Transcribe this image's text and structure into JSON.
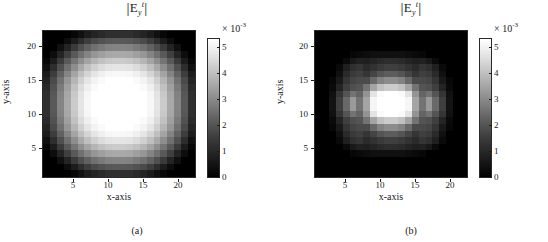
{
  "figure": {
    "panel_count": 2,
    "colormap": "grayscale-black-to-white"
  },
  "chart_data": [
    {
      "type": "heatmap",
      "panel": "a",
      "caption": "(a)",
      "title": "|E_y^t|",
      "title_parts": {
        "base": "E",
        "sub": "y",
        "sup": "t"
      },
      "xlabel": "x-axis",
      "ylabel": "y-axis",
      "xticks": [
        5,
        10,
        15,
        20
      ],
      "yticks": [
        5,
        10,
        15,
        20
      ],
      "xlim": [
        0.5,
        22.5
      ],
      "ylim": [
        0.5,
        22.5
      ],
      "grid_size": [
        22,
        22
      ],
      "colorbar": {
        "ticks": [
          0,
          1,
          2,
          3,
          4,
          5
        ],
        "tick_labels": [
          "0",
          "1",
          "2",
          "3",
          "4",
          "5"
        ],
        "exponent_label": "× 10",
        "exponent_value": "-3",
        "vmin": 0.0,
        "vmax": 0.0053,
        "units_multiplier": 0.001,
        "position": "right"
      },
      "description": "Smooth radially symmetric circular spot, bright saturated plateau at the centre decaying to black at the corners.",
      "values": [
        [
          0.0,
          0.0,
          0.0,
          0.0,
          0.02,
          0.05,
          0.09,
          0.12,
          0.14,
          0.16,
          0.16,
          0.16,
          0.16,
          0.14,
          0.12,
          0.09,
          0.05,
          0.02,
          0.0,
          0.0,
          0.0,
          0.0
        ],
        [
          0.0,
          0.0,
          0.0,
          0.04,
          0.09,
          0.15,
          0.21,
          0.26,
          0.29,
          0.31,
          0.32,
          0.32,
          0.31,
          0.29,
          0.26,
          0.21,
          0.15,
          0.09,
          0.04,
          0.0,
          0.0,
          0.0
        ],
        [
          0.0,
          0.0,
          0.05,
          0.12,
          0.2,
          0.28,
          0.35,
          0.41,
          0.45,
          0.48,
          0.49,
          0.49,
          0.48,
          0.45,
          0.41,
          0.35,
          0.28,
          0.2,
          0.12,
          0.05,
          0.0,
          0.0
        ],
        [
          0.0,
          0.04,
          0.12,
          0.22,
          0.32,
          0.41,
          0.49,
          0.56,
          0.6,
          0.63,
          0.64,
          0.64,
          0.63,
          0.6,
          0.56,
          0.49,
          0.41,
          0.32,
          0.22,
          0.12,
          0.04,
          0.0
        ],
        [
          0.02,
          0.09,
          0.2,
          0.32,
          0.43,
          0.53,
          0.62,
          0.69,
          0.74,
          0.77,
          0.78,
          0.78,
          0.77,
          0.74,
          0.69,
          0.62,
          0.53,
          0.43,
          0.32,
          0.2,
          0.09,
          0.02
        ],
        [
          0.05,
          0.15,
          0.28,
          0.41,
          0.53,
          0.64,
          0.73,
          0.8,
          0.85,
          0.88,
          0.89,
          0.89,
          0.88,
          0.85,
          0.8,
          0.73,
          0.64,
          0.53,
          0.41,
          0.28,
          0.15,
          0.05
        ],
        [
          0.09,
          0.21,
          0.35,
          0.49,
          0.62,
          0.73,
          0.82,
          0.89,
          0.93,
          0.96,
          0.97,
          0.97,
          0.96,
          0.93,
          0.89,
          0.82,
          0.73,
          0.62,
          0.49,
          0.35,
          0.21,
          0.09
        ],
        [
          0.12,
          0.26,
          0.41,
          0.56,
          0.69,
          0.8,
          0.89,
          0.95,
          0.98,
          1.0,
          1.0,
          1.0,
          1.0,
          0.98,
          0.95,
          0.89,
          0.8,
          0.69,
          0.56,
          0.41,
          0.26,
          0.12
        ],
        [
          0.14,
          0.29,
          0.45,
          0.6,
          0.74,
          0.85,
          0.93,
          0.98,
          1.0,
          1.0,
          1.0,
          1.0,
          1.0,
          1.0,
          0.98,
          0.93,
          0.85,
          0.74,
          0.6,
          0.45,
          0.29,
          0.14
        ],
        [
          0.16,
          0.31,
          0.48,
          0.63,
          0.77,
          0.88,
          0.96,
          1.0,
          1.0,
          1.0,
          1.0,
          1.0,
          1.0,
          1.0,
          1.0,
          0.96,
          0.88,
          0.77,
          0.63,
          0.48,
          0.31,
          0.16
        ],
        [
          0.16,
          0.32,
          0.49,
          0.64,
          0.78,
          0.89,
          0.97,
          1.0,
          1.0,
          1.0,
          1.0,
          1.0,
          1.0,
          1.0,
          1.0,
          0.97,
          0.89,
          0.78,
          0.64,
          0.49,
          0.32,
          0.16
        ],
        [
          0.16,
          0.32,
          0.49,
          0.64,
          0.78,
          0.89,
          0.97,
          1.0,
          1.0,
          1.0,
          1.0,
          1.0,
          1.0,
          1.0,
          1.0,
          0.97,
          0.89,
          0.78,
          0.64,
          0.49,
          0.32,
          0.16
        ],
        [
          0.16,
          0.31,
          0.48,
          0.63,
          0.77,
          0.88,
          0.96,
          1.0,
          1.0,
          1.0,
          1.0,
          1.0,
          1.0,
          1.0,
          1.0,
          0.96,
          0.88,
          0.77,
          0.63,
          0.48,
          0.31,
          0.16
        ],
        [
          0.14,
          0.29,
          0.45,
          0.6,
          0.74,
          0.85,
          0.93,
          0.98,
          1.0,
          1.0,
          1.0,
          1.0,
          1.0,
          1.0,
          0.98,
          0.93,
          0.85,
          0.74,
          0.6,
          0.45,
          0.29,
          0.14
        ],
        [
          0.12,
          0.26,
          0.41,
          0.56,
          0.69,
          0.8,
          0.89,
          0.95,
          0.98,
          1.0,
          1.0,
          1.0,
          1.0,
          0.98,
          0.95,
          0.89,
          0.8,
          0.69,
          0.56,
          0.41,
          0.26,
          0.12
        ],
        [
          0.09,
          0.21,
          0.35,
          0.49,
          0.62,
          0.73,
          0.82,
          0.89,
          0.93,
          0.96,
          0.97,
          0.97,
          0.96,
          0.93,
          0.89,
          0.82,
          0.73,
          0.62,
          0.49,
          0.35,
          0.21,
          0.09
        ],
        [
          0.05,
          0.15,
          0.28,
          0.41,
          0.53,
          0.64,
          0.73,
          0.8,
          0.85,
          0.88,
          0.89,
          0.89,
          0.88,
          0.85,
          0.8,
          0.73,
          0.64,
          0.53,
          0.41,
          0.28,
          0.15,
          0.05
        ],
        [
          0.02,
          0.09,
          0.2,
          0.32,
          0.43,
          0.53,
          0.62,
          0.69,
          0.74,
          0.77,
          0.78,
          0.78,
          0.77,
          0.74,
          0.69,
          0.62,
          0.53,
          0.43,
          0.32,
          0.2,
          0.09,
          0.02
        ],
        [
          0.0,
          0.04,
          0.12,
          0.22,
          0.32,
          0.41,
          0.49,
          0.56,
          0.6,
          0.63,
          0.64,
          0.64,
          0.63,
          0.6,
          0.56,
          0.49,
          0.41,
          0.32,
          0.22,
          0.12,
          0.04,
          0.0
        ],
        [
          0.0,
          0.0,
          0.05,
          0.12,
          0.2,
          0.28,
          0.35,
          0.41,
          0.45,
          0.48,
          0.49,
          0.49,
          0.48,
          0.45,
          0.41,
          0.35,
          0.28,
          0.2,
          0.12,
          0.05,
          0.0,
          0.0
        ],
        [
          0.0,
          0.0,
          0.0,
          0.04,
          0.09,
          0.15,
          0.21,
          0.26,
          0.29,
          0.31,
          0.32,
          0.32,
          0.31,
          0.29,
          0.26,
          0.21,
          0.15,
          0.09,
          0.04,
          0.0,
          0.0,
          0.0
        ],
        [
          0.0,
          0.0,
          0.0,
          0.0,
          0.02,
          0.05,
          0.09,
          0.12,
          0.14,
          0.16,
          0.16,
          0.16,
          0.16,
          0.14,
          0.12,
          0.09,
          0.05,
          0.02,
          0.0,
          0.0,
          0.0,
          0.0
        ]
      ]
    },
    {
      "type": "heatmap",
      "panel": "b",
      "caption": "(b)",
      "title": "|E_y^t|",
      "title_parts": {
        "base": "E",
        "sub": "y",
        "sup": "t"
      },
      "xlabel": "x-axis",
      "ylabel": "y-axis",
      "xticks": [
        5,
        10,
        15,
        20
      ],
      "yticks": [
        5,
        10,
        15,
        20
      ],
      "xlim": [
        0.5,
        22.5
      ],
      "ylim": [
        0.5,
        22.5
      ],
      "grid_size": [
        22,
        22
      ],
      "colorbar": {
        "ticks": [
          0,
          1,
          2,
          3,
          4,
          5
        ],
        "tick_labels": [
          "0",
          "1",
          "2",
          "3",
          "4",
          "5"
        ],
        "exponent_label": "× 10",
        "exponent_value": "-3",
        "vmin": 0.0,
        "vmax": 0.0053,
        "units_multiplier": 0.001,
        "position": "right"
      },
      "description": "Compact saturated square core at the centre surrounded by discrete satellite lobes forming a cross / diffraction-like pattern, dark background.",
      "values": [
        [
          0.0,
          0.0,
          0.0,
          0.0,
          0.0,
          0.0,
          0.0,
          0.0,
          0.0,
          0.0,
          0.0,
          0.0,
          0.0,
          0.0,
          0.0,
          0.0,
          0.0,
          0.0,
          0.0,
          0.0,
          0.0,
          0.0
        ],
        [
          0.0,
          0.0,
          0.0,
          0.0,
          0.0,
          0.0,
          0.0,
          0.0,
          0.0,
          0.0,
          0.0,
          0.0,
          0.0,
          0.0,
          0.0,
          0.0,
          0.0,
          0.0,
          0.0,
          0.0,
          0.0,
          0.0
        ],
        [
          0.0,
          0.0,
          0.0,
          0.0,
          0.0,
          0.0,
          0.0,
          0.0,
          0.0,
          0.0,
          0.0,
          0.0,
          0.0,
          0.0,
          0.0,
          0.0,
          0.0,
          0.0,
          0.0,
          0.0,
          0.0,
          0.0
        ],
        [
          0.0,
          0.0,
          0.0,
          0.0,
          0.0,
          0.02,
          0.03,
          0.04,
          0.05,
          0.05,
          0.05,
          0.05,
          0.05,
          0.04,
          0.03,
          0.02,
          0.0,
          0.0,
          0.0,
          0.0,
          0.0,
          0.0
        ],
        [
          0.0,
          0.0,
          0.0,
          0.0,
          0.03,
          0.08,
          0.11,
          0.1,
          0.12,
          0.14,
          0.15,
          0.15,
          0.14,
          0.12,
          0.1,
          0.11,
          0.08,
          0.03,
          0.0,
          0.0,
          0.0,
          0.0
        ],
        [
          0.0,
          0.0,
          0.0,
          0.03,
          0.1,
          0.16,
          0.18,
          0.14,
          0.17,
          0.2,
          0.22,
          0.22,
          0.2,
          0.17,
          0.14,
          0.18,
          0.16,
          0.1,
          0.03,
          0.0,
          0.0,
          0.0
        ],
        [
          0.0,
          0.0,
          0.0,
          0.05,
          0.14,
          0.2,
          0.22,
          0.18,
          0.24,
          0.3,
          0.33,
          0.33,
          0.3,
          0.24,
          0.18,
          0.22,
          0.2,
          0.14,
          0.05,
          0.0,
          0.0,
          0.0
        ],
        [
          0.0,
          0.0,
          0.02,
          0.08,
          0.18,
          0.24,
          0.26,
          0.26,
          0.38,
          0.48,
          0.52,
          0.52,
          0.48,
          0.38,
          0.26,
          0.26,
          0.24,
          0.18,
          0.08,
          0.02,
          0.0,
          0.0
        ],
        [
          0.0,
          0.0,
          0.03,
          0.12,
          0.22,
          0.28,
          0.3,
          0.42,
          0.62,
          0.74,
          0.78,
          0.78,
          0.74,
          0.62,
          0.42,
          0.3,
          0.28,
          0.22,
          0.12,
          0.03,
          0.0,
          0.0
        ],
        [
          0.0,
          0.0,
          0.05,
          0.18,
          0.3,
          0.42,
          0.36,
          0.55,
          0.88,
          0.98,
          1.0,
          1.0,
          0.98,
          0.88,
          0.55,
          0.36,
          0.42,
          0.3,
          0.18,
          0.05,
          0.0,
          0.0
        ],
        [
          0.0,
          0.0,
          0.06,
          0.22,
          0.38,
          0.58,
          0.42,
          0.62,
          0.96,
          1.0,
          1.0,
          1.0,
          1.0,
          0.96,
          0.62,
          0.42,
          0.58,
          0.38,
          0.22,
          0.06,
          0.0,
          0.0
        ],
        [
          0.0,
          0.0,
          0.06,
          0.22,
          0.38,
          0.58,
          0.42,
          0.62,
          0.96,
          1.0,
          1.0,
          1.0,
          1.0,
          0.96,
          0.62,
          0.42,
          0.58,
          0.38,
          0.22,
          0.06,
          0.0,
          0.0
        ],
        [
          0.0,
          0.0,
          0.05,
          0.18,
          0.3,
          0.42,
          0.36,
          0.55,
          0.88,
          0.98,
          1.0,
          1.0,
          0.98,
          0.88,
          0.55,
          0.36,
          0.42,
          0.3,
          0.18,
          0.05,
          0.0,
          0.0
        ],
        [
          0.0,
          0.0,
          0.03,
          0.12,
          0.22,
          0.28,
          0.3,
          0.42,
          0.62,
          0.74,
          0.78,
          0.78,
          0.74,
          0.62,
          0.42,
          0.3,
          0.28,
          0.22,
          0.12,
          0.03,
          0.0,
          0.0
        ],
        [
          0.0,
          0.0,
          0.02,
          0.08,
          0.18,
          0.24,
          0.26,
          0.26,
          0.38,
          0.48,
          0.52,
          0.52,
          0.48,
          0.38,
          0.26,
          0.26,
          0.24,
          0.18,
          0.08,
          0.02,
          0.0,
          0.0
        ],
        [
          0.0,
          0.0,
          0.0,
          0.05,
          0.14,
          0.2,
          0.22,
          0.18,
          0.24,
          0.3,
          0.33,
          0.33,
          0.3,
          0.24,
          0.18,
          0.22,
          0.2,
          0.14,
          0.05,
          0.0,
          0.0,
          0.0
        ],
        [
          0.0,
          0.0,
          0.0,
          0.03,
          0.1,
          0.16,
          0.18,
          0.14,
          0.17,
          0.2,
          0.22,
          0.22,
          0.2,
          0.17,
          0.14,
          0.18,
          0.16,
          0.1,
          0.03,
          0.0,
          0.0,
          0.0
        ],
        [
          0.0,
          0.0,
          0.0,
          0.0,
          0.03,
          0.08,
          0.11,
          0.1,
          0.12,
          0.14,
          0.15,
          0.15,
          0.14,
          0.12,
          0.1,
          0.11,
          0.08,
          0.03,
          0.0,
          0.0,
          0.0,
          0.0
        ],
        [
          0.0,
          0.0,
          0.0,
          0.0,
          0.0,
          0.02,
          0.03,
          0.04,
          0.05,
          0.05,
          0.05,
          0.05,
          0.05,
          0.04,
          0.03,
          0.02,
          0.0,
          0.0,
          0.0,
          0.0,
          0.0,
          0.0
        ],
        [
          0.0,
          0.0,
          0.0,
          0.0,
          0.0,
          0.0,
          0.0,
          0.0,
          0.0,
          0.0,
          0.0,
          0.0,
          0.0,
          0.0,
          0.0,
          0.0,
          0.0,
          0.0,
          0.0,
          0.0,
          0.0,
          0.0
        ],
        [
          0.0,
          0.0,
          0.0,
          0.0,
          0.0,
          0.0,
          0.0,
          0.0,
          0.0,
          0.0,
          0.0,
          0.0,
          0.0,
          0.0,
          0.0,
          0.0,
          0.0,
          0.0,
          0.0,
          0.0,
          0.0,
          0.0
        ],
        [
          0.0,
          0.0,
          0.0,
          0.0,
          0.0,
          0.0,
          0.0,
          0.0,
          0.0,
          0.0,
          0.0,
          0.0,
          0.0,
          0.0,
          0.0,
          0.0,
          0.0,
          0.0,
          0.0,
          0.0,
          0.0,
          0.0
        ]
      ]
    }
  ]
}
